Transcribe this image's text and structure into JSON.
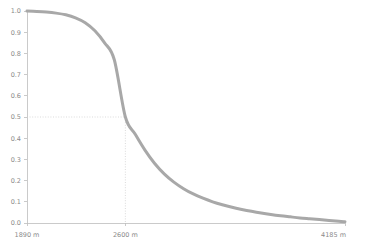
{
  "chart_data": {
    "type": "line",
    "title": "",
    "subtitle": "",
    "xlabel": "",
    "ylabel": "",
    "legend": [],
    "legend_position": "none",
    "grid": false,
    "background_color": "#ffffff",
    "series_color": "#a8a8a8",
    "axis_color": "#bdbdbd",
    "guide_color": "#cccccc",
    "xlim": [
      1890,
      4185
    ],
    "ylim": [
      0,
      1
    ],
    "x_unit": "m",
    "x_tick_labels": [
      "1890 m",
      "2600 m",
      "4185 m"
    ],
    "x_tick_values": [
      1890,
      2600,
      4185
    ],
    "y_tick_labels": [
      "0.0",
      "0.1",
      "0.2",
      "0.3",
      "0.4",
      "0.5",
      "0.6",
      "0.7",
      "0.8",
      "0.9",
      "1.0"
    ],
    "y_tick_values": [
      0.0,
      0.1,
      0.2,
      0.3,
      0.4,
      0.5,
      0.6,
      0.7,
      0.8,
      0.9,
      1.0
    ],
    "annotations": [
      {
        "name": "median-crossing",
        "x": 2600,
        "y": 0.5,
        "label": "",
        "style": "dotted-crosshair"
      }
    ],
    "x": [
      1890,
      1960,
      2030,
      2100,
      2170,
      2240,
      2310,
      2380,
      2450,
      2520,
      2600,
      2670,
      2740,
      2810,
      2880,
      2950,
      3020,
      3090,
      3160,
      3230,
      3300,
      3370,
      3440,
      3510,
      3580,
      3650,
      3720,
      3790,
      3860,
      3930,
      4000,
      4070,
      4140,
      4185
    ],
    "values": [
      1.0,
      0.998,
      0.995,
      0.99,
      0.982,
      0.968,
      0.945,
      0.907,
      0.85,
      0.77,
      0.5,
      0.42,
      0.345,
      0.282,
      0.232,
      0.193,
      0.162,
      0.137,
      0.117,
      0.1,
      0.086,
      0.074,
      0.064,
      0.055,
      0.047,
      0.04,
      0.034,
      0.029,
      0.024,
      0.02,
      0.016,
      0.012,
      0.008,
      0.006
    ]
  }
}
